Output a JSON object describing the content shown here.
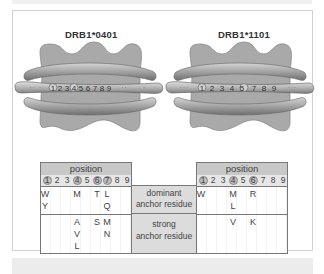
{
  "molecules": [
    {
      "title": "DRB1*0401",
      "peptide_positions": [
        "1",
        "2",
        "3",
        "4",
        "5",
        "6",
        "7",
        "8",
        "9"
      ],
      "highlighted_positions": [
        "1",
        "4",
        "6",
        "7"
      ]
    },
    {
      "title": "DRB1*1101",
      "peptide_positions": [
        "1",
        "2",
        "3",
        "4",
        "5",
        "6",
        "7",
        "8",
        "9"
      ],
      "highlighted_positions": [
        "1",
        "4",
        "6"
      ]
    }
  ],
  "legend": {
    "dominant": "dominant\nanchor residue",
    "dominant_line1": "dominant",
    "dominant_line2": "anchor residue",
    "strong_line1": "strong",
    "strong_line2": "anchor residue"
  },
  "tables": [
    {
      "header": "position",
      "positions": [
        "1",
        "2",
        "3",
        "4",
        "5",
        "6",
        "7",
        "8",
        "9"
      ],
      "circled": [
        1,
        4,
        6,
        7
      ],
      "dominant": [
        {
          "pos": 1,
          "line": 0,
          "residue": "W"
        },
        {
          "pos": 1,
          "line": 1,
          "residue": "Y"
        },
        {
          "pos": 4,
          "line": 0,
          "residue": "M"
        },
        {
          "pos": 6,
          "line": 0,
          "residue": "T"
        },
        {
          "pos": 7,
          "line": 0,
          "residue": "L"
        },
        {
          "pos": 7,
          "line": 1,
          "residue": "Q"
        }
      ],
      "strong": [
        {
          "pos": 4,
          "line": 0,
          "residue": "A"
        },
        {
          "pos": 4,
          "line": 1,
          "residue": "V"
        },
        {
          "pos": 4,
          "line": 2,
          "residue": "L"
        },
        {
          "pos": 6,
          "line": 0,
          "residue": "S"
        },
        {
          "pos": 7,
          "line": 0,
          "residue": "M"
        },
        {
          "pos": 7,
          "line": 1,
          "residue": "N"
        }
      ]
    },
    {
      "header": "position",
      "positions": [
        "1",
        "2",
        "3",
        "4",
        "5",
        "6",
        "7",
        "8",
        "9"
      ],
      "circled": [
        1,
        4,
        6
      ],
      "dominant": [
        {
          "pos": 1,
          "line": 0,
          "residue": "W"
        },
        {
          "pos": 4,
          "line": 0,
          "residue": "M"
        },
        {
          "pos": 4,
          "line": 1,
          "residue": "L"
        },
        {
          "pos": 6,
          "line": 0,
          "residue": "R"
        }
      ],
      "strong": [
        {
          "pos": 4,
          "line": 0,
          "residue": "V"
        },
        {
          "pos": 6,
          "line": 0,
          "residue": "K"
        }
      ]
    }
  ],
  "colors": {
    "molecule_fill": "#a9a9a9",
    "helix_fill": "#9a9a9a",
    "table_header": "#c8c8c8",
    "label_column": "#dcdcdc"
  }
}
